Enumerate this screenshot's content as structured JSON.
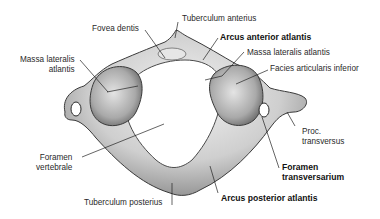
{
  "diagram": {
    "labels": [
      {
        "id": "fovea-dentis",
        "text": "Fovea dentis",
        "bold": false
      },
      {
        "id": "tuberculum-anterius",
        "text": "Tuberculum anterius",
        "bold": false
      },
      {
        "id": "arcus-anterior-atlantis",
        "text": "Arcus anterior atlantis",
        "bold": true
      },
      {
        "id": "massa-lateralis-atlantis-left",
        "text": "Massa lateralis\natlantis",
        "bold": false
      },
      {
        "id": "massa-lateralis-atlantis-right",
        "text": "Massa lateralis atlantis",
        "bold": false
      },
      {
        "id": "facies-articularis-inferior",
        "text": "Facies articularis inferior",
        "bold": false
      },
      {
        "id": "proc-transversus",
        "text": "Proc.\ntransversus",
        "bold": false
      },
      {
        "id": "foramen-vertebrale",
        "text": "Foramen\nvertebrale",
        "bold": false
      },
      {
        "id": "foramen-transversarium",
        "text": "Foramen\ntransversarium",
        "bold": true
      },
      {
        "id": "tuberculum-posterius",
        "text": "Tuberculum posterius",
        "bold": false
      },
      {
        "id": "arcus-posterior-atlantis",
        "text": "Arcus posterior atlantis",
        "bold": true
      }
    ],
    "colors": {
      "bone_light": "#e8e8e8",
      "bone_mid": "#b5b5b5",
      "bone_dark": "#6f6f6f",
      "outline": "#3a3a3a",
      "leader": "#222222"
    }
  }
}
